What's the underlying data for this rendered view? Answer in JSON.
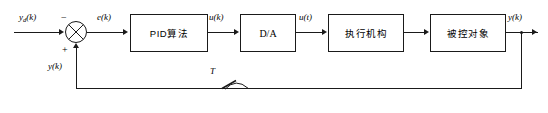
{
  "diagram": {
    "blocks": [
      {
        "id": "pid",
        "label": "PID算法",
        "x": 130,
        "y": 14,
        "w": 78,
        "h": 38
      },
      {
        "id": "da",
        "label": "D/A",
        "x": 240,
        "y": 14,
        "w": 56,
        "h": 38
      },
      {
        "id": "actuator",
        "label": "执行机构",
        "x": 328,
        "y": 14,
        "w": 76,
        "h": 38
      },
      {
        "id": "plant",
        "label": "被控对象",
        "x": 430,
        "y": 14,
        "w": 76,
        "h": 38
      }
    ],
    "signals": {
      "reference": "y",
      "reference_sub": "d",
      "reference_arg": "(k)",
      "error": "e(k)",
      "control_discrete": "u(k)",
      "control_continuous": "u(t)",
      "output": "y(k)",
      "feedback": "y(k)",
      "sample_period": "T"
    },
    "summing_junction": {
      "name": "comparator",
      "cx": 76,
      "cy": 32,
      "r": 11,
      "minus_sign": "−",
      "plus_sign": "+"
    },
    "sampler": {
      "label": "T",
      "x": 222,
      "y": 88
    },
    "colors": {
      "line": "#1a1a1a",
      "background": "#ffffff",
      "text": "#000000"
    }
  }
}
